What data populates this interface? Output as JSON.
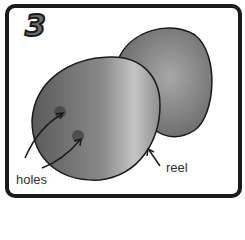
{
  "panel": {
    "step_number": "3",
    "labels": {
      "holes": "holes",
      "reel": "reel"
    },
    "colors": {
      "border": "#1a1a1a",
      "object_dark": "#555555",
      "object_light": "#b5b5b5",
      "step_fill": "#6b6b6b"
    }
  }
}
